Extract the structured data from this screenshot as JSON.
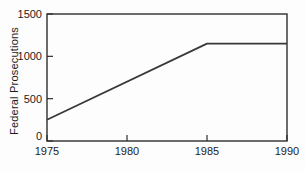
{
  "figure": {
    "background_color": "#fdfdfd",
    "axis_color": "#2e2e2e",
    "line_color": "#383838",
    "text_color": "#1c1c1c"
  },
  "chart_data": {
    "type": "line",
    "title": "",
    "xlabel": "",
    "ylabel": "Federal Prosecutions",
    "xlim": [
      1975,
      1990
    ],
    "ylim": [
      0,
      1500
    ],
    "xticks": [
      1975,
      1980,
      1985,
      1990
    ],
    "yticks": [
      0,
      500,
      1000,
      1500
    ],
    "grid": false,
    "legend": false,
    "frame": "box",
    "series": [
      {
        "name": "Federal Prosecutions",
        "x": [
          1975,
          1985,
          1990
        ],
        "values": [
          250,
          1150,
          1150
        ]
      }
    ]
  }
}
